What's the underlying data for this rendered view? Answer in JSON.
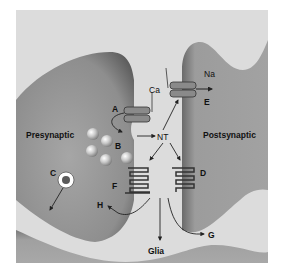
{
  "diagram": {
    "type": "synapse schematic",
    "regions": {
      "presynaptic": "Presynaptic",
      "postsynaptic": "Postsynaptic",
      "glia": "Glia"
    },
    "ions": {
      "calcium": "Ca",
      "sodium": "Na"
    },
    "neurotransmitter": "NT",
    "markers": {
      "a": "A",
      "b": "B",
      "c": "C",
      "d": "D",
      "e": "E",
      "f": "F",
      "g": "G",
      "h": "H"
    },
    "colors": {
      "cleft": "#dcdcdc",
      "cell_body": "#9a9a9a",
      "cell_shadow": "#6e6e6e",
      "ink": "#222222",
      "vesicle": "#c8c8c8",
      "marker_c_core": "#5a5a5a"
    }
  }
}
